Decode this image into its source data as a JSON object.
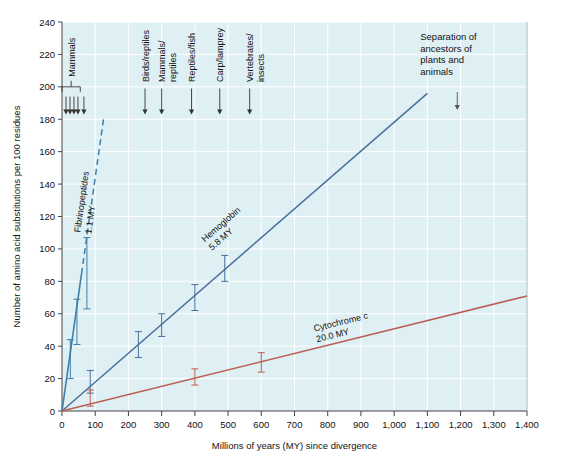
{
  "figure": {
    "background_color": "#ffffff",
    "plot_background_color": "#dff0f5",
    "grid_color": "#ffffff",
    "axis_color": "#444444"
  },
  "axes": {
    "x": {
      "label": "Millions of years (MY) since divergence",
      "min": 0,
      "max": 1400,
      "step": 100,
      "ticks": [
        "0",
        "100",
        "200",
        "300",
        "400",
        "500",
        "600",
        "700",
        "800",
        "900",
        "1,000",
        "1,100",
        "1,200",
        "1,300",
        "1,400"
      ]
    },
    "y": {
      "label": "Number of amino acid substitutions per 100 residues",
      "min": 0,
      "max": 240,
      "step": 20,
      "ticks": [
        "0",
        "20",
        "40",
        "60",
        "80",
        "100",
        "120",
        "140",
        "160",
        "180",
        "200",
        "220",
        "240"
      ]
    }
  },
  "annotations": {
    "mammals_bracket": {
      "label": "Mammals",
      "x_start": 0,
      "x_end": 55,
      "arrow_positions": [
        12,
        24,
        36,
        48,
        66
      ]
    },
    "divergence_events": [
      {
        "label": "Birds/reptiles",
        "x": 250
      },
      {
        "label": "Mammals/\nreptiles",
        "x": 300
      },
      {
        "label": "Reptiles/fish",
        "x": 390
      },
      {
        "label": "Carp/lamprey",
        "x": 475
      },
      {
        "label": "Vertebrates/\ninsects",
        "x": 565
      }
    ],
    "separation_note": {
      "line1": "Separation of",
      "line2": "ancestors of",
      "line3": "plants and",
      "line4": "animals",
      "arrow_x": 1190
    }
  },
  "chart_data": {
    "type": "line",
    "title": "",
    "xlabel": "Millions of years (MY) since divergence",
    "ylabel": "Number of amino acid substitutions per 100 residues",
    "xlim": [
      0,
      1400
    ],
    "ylim": [
      0,
      240
    ],
    "grid": true,
    "legend": "inline-labels",
    "series": [
      {
        "name": "Fibrinopeptides",
        "rate_label": "1.1 MY",
        "color": "#3d7fa8",
        "line_style": "solid-then-dashed",
        "x": [
          0,
          25,
          45,
          75
        ],
        "y": [
          0,
          32,
          55,
          85
        ],
        "errors": [
          0,
          12,
          14,
          22
        ],
        "fit_x": [
          0,
          125
        ],
        "fit_y": [
          0,
          180
        ]
      },
      {
        "name": "Hemoglobin",
        "rate_label": "5.8 MY",
        "color": "#4a6f9c",
        "line_style": "solid",
        "x": [
          0,
          85,
          230,
          300,
          400,
          490
        ],
        "y": [
          0,
          18,
          41,
          53,
          70,
          88
        ],
        "errors": [
          0,
          7,
          8,
          7,
          8,
          8
        ],
        "fit_x": [
          0,
          1100
        ],
        "fit_y": [
          0,
          196
        ]
      },
      {
        "name": "Cytochrome c",
        "rate_label": "20.0 MY",
        "color": "#bb5f52",
        "line_style": "solid",
        "x": [
          0,
          85,
          400,
          600
        ],
        "y": [
          0,
          8,
          21,
          30
        ],
        "errors": [
          0,
          5,
          5,
          6
        ],
        "fit_x": [
          0,
          1400
        ],
        "fit_y": [
          0,
          71
        ]
      }
    ]
  }
}
